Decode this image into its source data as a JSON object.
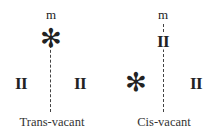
{
  "diagrams": [
    {
      "name": "trans-vacant",
      "top_label": "m",
      "top_site": "✻",
      "left_site": "II",
      "right_site": "II",
      "caption": "Trans-vacant"
    },
    {
      "name": "cis-vacant",
      "top_label": "m",
      "top_site": "II",
      "left_site": "✻",
      "right_site": "II",
      "caption": "Cis-vacant"
    }
  ]
}
